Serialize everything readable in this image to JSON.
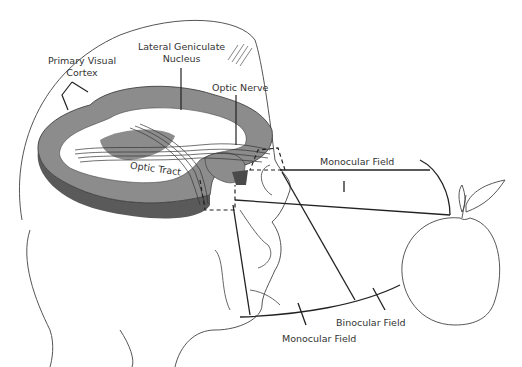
{
  "diagram": {
    "labels": {
      "primary_visual_cortex_line1": "Primary Visual",
      "primary_visual_cortex_line2": "Cortex",
      "lgn_line1": "Lateral Geniculate",
      "lgn_line2": "Nucleus",
      "optic_nerve": "Optic Nerve",
      "optic_tract": "Optic Tract",
      "monocular_field_top": "Monocular Field",
      "binocular_field": "Binocular Field",
      "monocular_field_bottom": "Monocular Field"
    },
    "colors": {
      "brain_light": "#8c8c8c",
      "brain_dark": "#5a5a5a",
      "line": "#222222",
      "outline": "#555555"
    },
    "objects": [
      "head",
      "brain",
      "eye",
      "apple"
    ]
  }
}
